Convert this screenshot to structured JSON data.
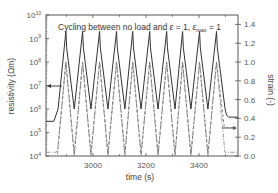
{
  "chart_data": {
    "type": "line",
    "title": "",
    "annotation": "Cycling between no load and ε = 1, ε_max = 1",
    "annotation_parts": {
      "prefix": "Cycling between no load and ",
      "eps": "ε",
      "eq1": " = 1, ",
      "emax": "ε",
      "emax_sub": "max",
      "eq2": " = 1"
    },
    "xlabel": "time (s)",
    "ylabel_left": "resistivity (Ωm)",
    "ylabel_right": "strain (-)",
    "xlim": [
      2823,
      3547
    ],
    "ylim_left": [
      10000.0,
      10000000000.0
    ],
    "ylim_left_scale": "log",
    "ylim_right": [
      0.0,
      1.5
    ],
    "x_ticks": [
      3000,
      3200,
      3400
    ],
    "x_tick_labels": [
      "3000",
      "3200",
      "3400"
    ],
    "y_left_ticks": [
      "10^4",
      "10^5",
      "10^6",
      "10^7",
      "10^8",
      "10^9",
      "10^10"
    ],
    "y_left_exponents": [
      "4",
      "5",
      "6",
      "7",
      "8",
      "9",
      "10"
    ],
    "y_right_ticks": [
      "0.0",
      "0.2",
      "0.4",
      "0.6",
      "0.8",
      "1.0",
      "1.2",
      "1.4"
    ],
    "grid": false,
    "legend": null,
    "series": [
      {
        "name": "resistivity",
        "axis": "left",
        "style": "solid",
        "color": "#333333",
        "cycles": 10,
        "period_s": 63,
        "peak": 2000000000.0,
        "trough": 1000000.0,
        "start_value": 300000.0,
        "end_value": 400000.0
      },
      {
        "name": "strain",
        "axis": "right",
        "style": "dashed",
        "color": "#666666",
        "cycles": 10,
        "peak": 1.0,
        "trough": 0.02,
        "end_value": 0.3
      },
      {
        "name": "strain (applied)",
        "axis": "right",
        "style": "dash-dot",
        "color": "#888888",
        "cycles": 10,
        "peak": 1.0,
        "trough": 0.0,
        "start_value": 0.04,
        "end_value": 0.04
      }
    ],
    "peak_times_s": [
      2898,
      2961,
      3025,
      3089,
      3150,
      3214,
      3278,
      3338,
      3402,
      3466
    ],
    "arrows": [
      {
        "points_to": "left-axis",
        "at_value": "1e7"
      },
      {
        "points_to": "right-axis",
        "at_value": 0.3
      }
    ]
  }
}
